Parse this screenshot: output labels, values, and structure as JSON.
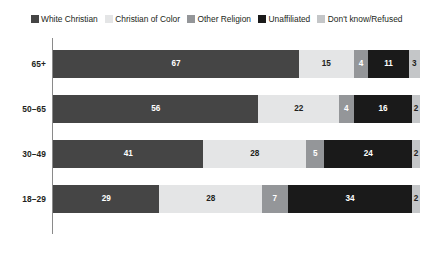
{
  "legend": {
    "items": [
      {
        "label": "White Christian",
        "color": "#454545"
      },
      {
        "label": "Christian of Color",
        "color": "#e4e5e6"
      },
      {
        "label": "Other Religion",
        "color": "#949699"
      },
      {
        "label": "Unaffiliated",
        "color": "#1a1a1a"
      },
      {
        "label": "Don't know/Refused",
        "color": "#c4c6c8"
      }
    ]
  },
  "chart_data": {
    "type": "bar",
    "orientation": "horizontal",
    "stacked": true,
    "title": "",
    "subtitle": "",
    "xlabel": "",
    "ylabel": "",
    "xlim": [
      0,
      100
    ],
    "grid": false,
    "legend_position": "top",
    "categories": [
      "65+",
      "50–65",
      "30–49",
      "18–29"
    ],
    "series": [
      {
        "name": "White Christian",
        "color": "#454545",
        "text_color": "#ffffff",
        "values": [
          67,
          56,
          41,
          29
        ]
      },
      {
        "name": "Christian of Color",
        "color": "#e4e5e6",
        "text_color": "#231f20",
        "values": [
          15,
          22,
          28,
          28
        ]
      },
      {
        "name": "Other Religion",
        "color": "#949699",
        "text_color": "#ffffff",
        "values": [
          4,
          4,
          5,
          7
        ]
      },
      {
        "name": "Unaffiliated",
        "color": "#1a1a1a",
        "text_color": "#ffffff",
        "values": [
          11,
          16,
          24,
          34
        ]
      },
      {
        "name": "Don't know/Refused",
        "color": "#c4c6c8",
        "text_color": "#231f20",
        "values": [
          3,
          2,
          2,
          2
        ]
      }
    ],
    "rows": [
      {
        "category": "65+",
        "segments": [
          {
            "name": "White Christian",
            "value": 67,
            "label": "67"
          },
          {
            "name": "Christian of Color",
            "value": 15,
            "label": "15"
          },
          {
            "name": "Other Religion",
            "value": 4,
            "label": "4"
          },
          {
            "name": "Unaffiliated",
            "value": 11,
            "label": "11"
          },
          {
            "name": "Don't know/Refused",
            "value": 3,
            "label": "3"
          }
        ]
      },
      {
        "category": "50–65",
        "segments": [
          {
            "name": "White Christian",
            "value": 56,
            "label": "56"
          },
          {
            "name": "Christian of Color",
            "value": 22,
            "label": "22"
          },
          {
            "name": "Other Religion",
            "value": 4,
            "label": "4"
          },
          {
            "name": "Unaffiliated",
            "value": 16,
            "label": "16"
          },
          {
            "name": "Don't know/Refused",
            "value": 2,
            "label": "2"
          }
        ]
      },
      {
        "category": "30–49",
        "segments": [
          {
            "name": "White Christian",
            "value": 41,
            "label": "41"
          },
          {
            "name": "Christian of Color",
            "value": 28,
            "label": "28"
          },
          {
            "name": "Other Religion",
            "value": 5,
            "label": "5"
          },
          {
            "name": "Unaffiliated",
            "value": 24,
            "label": "24"
          },
          {
            "name": "Don't know/Refused",
            "value": 2,
            "label": "2"
          }
        ]
      },
      {
        "category": "18–29",
        "segments": [
          {
            "name": "White Christian",
            "value": 29,
            "label": "29"
          },
          {
            "name": "Christian of Color",
            "value": 28,
            "label": "28"
          },
          {
            "name": "Other Religion",
            "value": 7,
            "label": "7"
          },
          {
            "name": "Unaffiliated",
            "value": 34,
            "label": "34"
          },
          {
            "name": "Don't know/Refused",
            "value": 2,
            "label": "2"
          }
        ]
      }
    ]
  },
  "layout": {
    "row_tops": [
      12,
      57,
      102,
      147
    ],
    "axis_color": "#8a8a8a",
    "background": "#ffffff"
  }
}
